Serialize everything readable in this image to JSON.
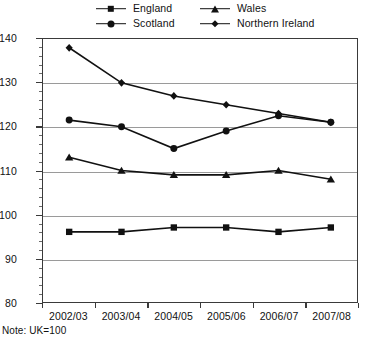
{
  "legend": {
    "position": "top",
    "items": [
      {
        "label": "England",
        "marker": "square-marker"
      },
      {
        "label": "Wales",
        "marker": "triangle-marker"
      },
      {
        "label": "Scotland",
        "marker": "circle-marker"
      },
      {
        "label": "Northern Ireland",
        "marker": "diamond-marker"
      }
    ]
  },
  "note": "Note: UK=100",
  "chart_data": {
    "type": "line",
    "title": "",
    "subtitle": "",
    "xlabel": "",
    "ylabel": "",
    "categories": [
      "2002/03",
      "2003/04",
      "2004/05",
      "2005/06",
      "2006/07",
      "2007/08"
    ],
    "ylim": [
      80,
      140
    ],
    "yticks": [
      80,
      90,
      100,
      110,
      120,
      130,
      140
    ],
    "ytick_labels": [
      "80",
      "90",
      "100",
      "110",
      "120",
      "130",
      "140"
    ],
    "minor_tick_step": 2,
    "grid": "horizontal",
    "legend_position": "top",
    "annotations": [
      "Note: UK=100"
    ],
    "series": [
      {
        "name": "England",
        "marker": "square",
        "color": "#111111",
        "values": [
          96,
          96,
          97,
          97,
          96,
          97
        ]
      },
      {
        "name": "Scotland",
        "marker": "circle",
        "color": "#111111",
        "values": [
          121.5,
          120,
          115,
          119,
          122.5,
          121
        ]
      },
      {
        "name": "Wales",
        "marker": "triangle",
        "color": "#111111",
        "values": [
          113,
          110,
          109,
          109,
          110,
          108
        ]
      },
      {
        "name": "Northern Ireland",
        "marker": "diamond",
        "color": "#111111",
        "values": [
          138,
          130,
          127,
          125,
          123,
          121
        ]
      }
    ]
  }
}
